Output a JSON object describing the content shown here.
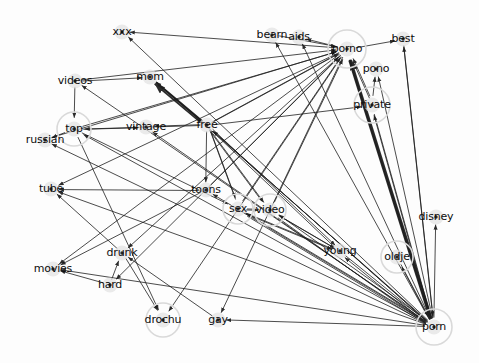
{
  "figure": {
    "type": "network-graph",
    "title": "",
    "background_color": "#fdfdfd",
    "edge_color": "#1c1c1c",
    "node_label_color": "#0d0d0d",
    "node_halo_color": "#d9d9d9",
    "node_glow_color": "#e2e2e2",
    "width": 479,
    "height": 363
  },
  "chart_data": {
    "type": "graph",
    "title": "",
    "xlabel": "",
    "ylabel": "",
    "directed": true,
    "nodes": [
      {
        "id": "xxx",
        "label": "xxx",
        "x": 122,
        "y": 32,
        "highlighted": false,
        "halo_r": 0
      },
      {
        "id": "bearn",
        "label": "bearn",
        "x": 272,
        "y": 35,
        "highlighted": false,
        "halo_r": 0
      },
      {
        "id": "aids",
        "label": "aids",
        "x": 299,
        "y": 37,
        "highlighted": false,
        "halo_r": 0
      },
      {
        "id": "porno",
        "label": "porno",
        "x": 347,
        "y": 49,
        "highlighted": true,
        "halo_r": 19
      },
      {
        "id": "best",
        "label": "best",
        "x": 403,
        "y": 39,
        "highlighted": false,
        "halo_r": 0
      },
      {
        "id": "pono",
        "label": "pono",
        "x": 376,
        "y": 69,
        "highlighted": false,
        "halo_r": 0
      },
      {
        "id": "videos",
        "label": "videos",
        "x": 75,
        "y": 81,
        "highlighted": false,
        "halo_r": 0
      },
      {
        "id": "mom",
        "label": "mom",
        "x": 150,
        "y": 77,
        "highlighted": false,
        "halo_r": 0
      },
      {
        "id": "private",
        "label": "private",
        "x": 372,
        "y": 105,
        "highlighted": true,
        "halo_r": 18
      },
      {
        "id": "top",
        "label": "top",
        "x": 74,
        "y": 129,
        "highlighted": true,
        "halo_r": 17
      },
      {
        "id": "vintage",
        "label": "vintage",
        "x": 146,
        "y": 127,
        "highlighted": false,
        "halo_r": 0
      },
      {
        "id": "free",
        "label": "free",
        "x": 207,
        "y": 125,
        "highlighted": false,
        "halo_r": 0
      },
      {
        "id": "russian",
        "label": "russian",
        "x": 45,
        "y": 140,
        "highlighted": false,
        "halo_r": 0
      },
      {
        "id": "tube",
        "label": "tube",
        "x": 51,
        "y": 189,
        "highlighted": false,
        "halo_r": 0
      },
      {
        "id": "toons",
        "label": "toons",
        "x": 206,
        "y": 190,
        "highlighted": false,
        "halo_r": 0
      },
      {
        "id": "sex",
        "label": "sex",
        "x": 238,
        "y": 209,
        "highlighted": true,
        "halo_r": 15
      },
      {
        "id": "video",
        "label": "video",
        "x": 270,
        "y": 210,
        "highlighted": true,
        "halo_r": 16
      },
      {
        "id": "disney",
        "label": "disney",
        "x": 436,
        "y": 217,
        "highlighted": false,
        "halo_r": 0
      },
      {
        "id": "drunk",
        "label": "drunk",
        "x": 122,
        "y": 253,
        "highlighted": false,
        "halo_r": 0
      },
      {
        "id": "young",
        "label": "young",
        "x": 340,
        "y": 251,
        "highlighted": false,
        "halo_r": 0
      },
      {
        "id": "oldje",
        "label": "oldje",
        "x": 397,
        "y": 257,
        "highlighted": true,
        "halo_r": 16
      },
      {
        "id": "movies",
        "label": "movies",
        "x": 53,
        "y": 269,
        "highlighted": false,
        "halo_r": 0
      },
      {
        "id": "hard",
        "label": "hard",
        "x": 110,
        "y": 285,
        "highlighted": false,
        "halo_r": 0
      },
      {
        "id": "drochu",
        "label": "drochu",
        "x": 163,
        "y": 320,
        "highlighted": true,
        "halo_r": 17
      },
      {
        "id": "gay",
        "label": "gay",
        "x": 218,
        "y": 320,
        "highlighted": false,
        "halo_r": 0
      },
      {
        "id": "porn",
        "label": "porn",
        "x": 434,
        "y": 327,
        "highlighted": true,
        "halo_r": 18
      }
    ],
    "edges": [
      {
        "source": "porn",
        "target": "xxx",
        "weight": 1
      },
      {
        "source": "porn",
        "target": "bearn",
        "weight": 1
      },
      {
        "source": "porn",
        "target": "aids",
        "weight": 1
      },
      {
        "source": "porn",
        "target": "porno",
        "weight": 3
      },
      {
        "source": "porn",
        "target": "best",
        "weight": 1
      },
      {
        "source": "porn",
        "target": "pono",
        "weight": 1
      },
      {
        "source": "porn",
        "target": "private",
        "weight": 2
      },
      {
        "source": "porn",
        "target": "disney",
        "weight": 1
      },
      {
        "source": "porn",
        "target": "oldje",
        "weight": 1
      },
      {
        "source": "porn",
        "target": "young",
        "weight": 2
      },
      {
        "source": "porn",
        "target": "video",
        "weight": 2
      },
      {
        "source": "porn",
        "target": "sex",
        "weight": 2
      },
      {
        "source": "porn",
        "target": "toons",
        "weight": 1
      },
      {
        "source": "porn",
        "target": "free",
        "weight": 2
      },
      {
        "source": "porn",
        "target": "vintage",
        "weight": 1
      },
      {
        "source": "porn",
        "target": "top",
        "weight": 1
      },
      {
        "source": "porn",
        "target": "russian",
        "weight": 1
      },
      {
        "source": "porn",
        "target": "movies",
        "weight": 1
      },
      {
        "source": "porn",
        "target": "tube",
        "weight": 1
      },
      {
        "source": "porn",
        "target": "gay",
        "weight": 1
      },
      {
        "source": "porn",
        "target": "mom",
        "weight": 1
      },
      {
        "source": "porn",
        "target": "videos",
        "weight": 1
      },
      {
        "source": "free",
        "target": "porno",
        "weight": 2
      },
      {
        "source": "free",
        "target": "mom",
        "weight": 3
      },
      {
        "source": "free",
        "target": "vintage",
        "weight": 1
      },
      {
        "source": "free",
        "target": "top",
        "weight": 1
      },
      {
        "source": "free",
        "target": "sex",
        "weight": 2
      },
      {
        "source": "free",
        "target": "video",
        "weight": 2
      },
      {
        "source": "free",
        "target": "young",
        "weight": 2
      },
      {
        "source": "free",
        "target": "private",
        "weight": 1
      },
      {
        "source": "free",
        "target": "toons",
        "weight": 1
      },
      {
        "source": "videos",
        "target": "mom",
        "weight": 1
      },
      {
        "source": "videos",
        "target": "top",
        "weight": 1
      },
      {
        "source": "videos",
        "target": "porno",
        "weight": 1
      },
      {
        "source": "top",
        "target": "porno",
        "weight": 1
      },
      {
        "source": "top",
        "target": "vintage",
        "weight": 1
      },
      {
        "source": "top",
        "target": "russian",
        "weight": 1
      },
      {
        "source": "top",
        "target": "drochu",
        "weight": 1
      },
      {
        "source": "top",
        "target": "sex",
        "weight": 1
      },
      {
        "source": "russian",
        "target": "porno",
        "weight": 1
      },
      {
        "source": "sex",
        "target": "porno",
        "weight": 1
      },
      {
        "source": "sex",
        "target": "video",
        "weight": 2
      },
      {
        "source": "sex",
        "target": "young",
        "weight": 2
      },
      {
        "source": "video",
        "target": "young",
        "weight": 2
      },
      {
        "source": "video",
        "target": "porno",
        "weight": 1
      },
      {
        "source": "toons",
        "target": "porno",
        "weight": 1
      },
      {
        "source": "toons",
        "target": "tube",
        "weight": 1
      },
      {
        "source": "toons",
        "target": "movies",
        "weight": 1
      },
      {
        "source": "private",
        "target": "porno",
        "weight": 2
      },
      {
        "source": "private",
        "target": "pono",
        "weight": 1
      },
      {
        "source": "porno",
        "target": "best",
        "weight": 1
      },
      {
        "source": "porno",
        "target": "xxx",
        "weight": 1
      },
      {
        "source": "porno",
        "target": "aids",
        "weight": 1
      },
      {
        "source": "porno",
        "target": "hard",
        "weight": 1
      },
      {
        "source": "porno",
        "target": "drunk",
        "weight": 1
      },
      {
        "source": "porno",
        "target": "movies",
        "weight": 1
      },
      {
        "source": "porno",
        "target": "gay",
        "weight": 1
      },
      {
        "source": "porno",
        "target": "drochu",
        "weight": 1
      },
      {
        "source": "porno",
        "target": "tube",
        "weight": 1
      },
      {
        "source": "bearn",
        "target": "porno",
        "weight": 1
      },
      {
        "source": "drunk",
        "target": "tube",
        "weight": 1
      },
      {
        "source": "drunk",
        "target": "drochu",
        "weight": 1
      },
      {
        "source": "hard",
        "target": "movies",
        "weight": 1
      },
      {
        "source": "hard",
        "target": "drunk",
        "weight": 1
      },
      {
        "source": "gay",
        "target": "drunk",
        "weight": 1
      },
      {
        "source": "oldje",
        "target": "porn",
        "weight": 1
      },
      {
        "source": "best",
        "target": "porn",
        "weight": 1
      }
    ]
  }
}
